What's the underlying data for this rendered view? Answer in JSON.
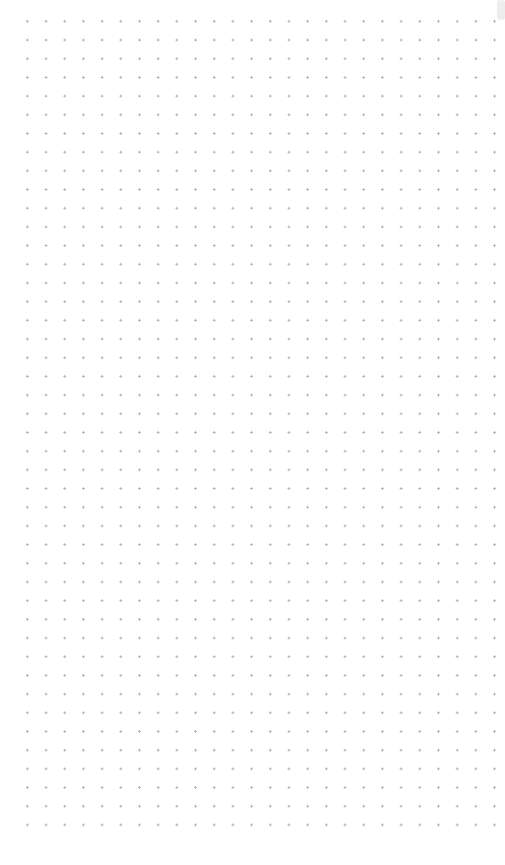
{
  "canvas": {
    "type": "dot-grid",
    "background_color": "#ffffff",
    "dot_color": "#a8a8a8",
    "dot_spacing_px": 18.7,
    "columns": 25,
    "rows": 43
  },
  "scrollbar": {
    "thumb_color": "#eeeeee"
  }
}
